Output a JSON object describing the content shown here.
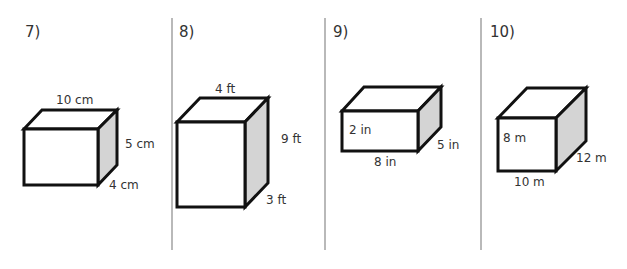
{
  "problems": [
    {
      "number": "7)",
      "dimensions": {
        "length": "10 cm",
        "height": "5 cm",
        "depth": "4 cm"
      }
    },
    {
      "number": "8)",
      "dimensions": {
        "length": "4 ft",
        "height": "9 ft",
        "depth": "3 ft"
      }
    },
    {
      "number": "9)",
      "dimensions": {
        "length": "8 in",
        "height": "2 in",
        "depth": "5 in"
      }
    },
    {
      "number": "10)",
      "dimensions": {
        "length": "10 m",
        "height": "8 m",
        "depth": "12 m"
      }
    }
  ],
  "colors": {
    "shaded_face": "#d4d4d4",
    "outline": "#111111",
    "divider": "#8a8a8a"
  }
}
